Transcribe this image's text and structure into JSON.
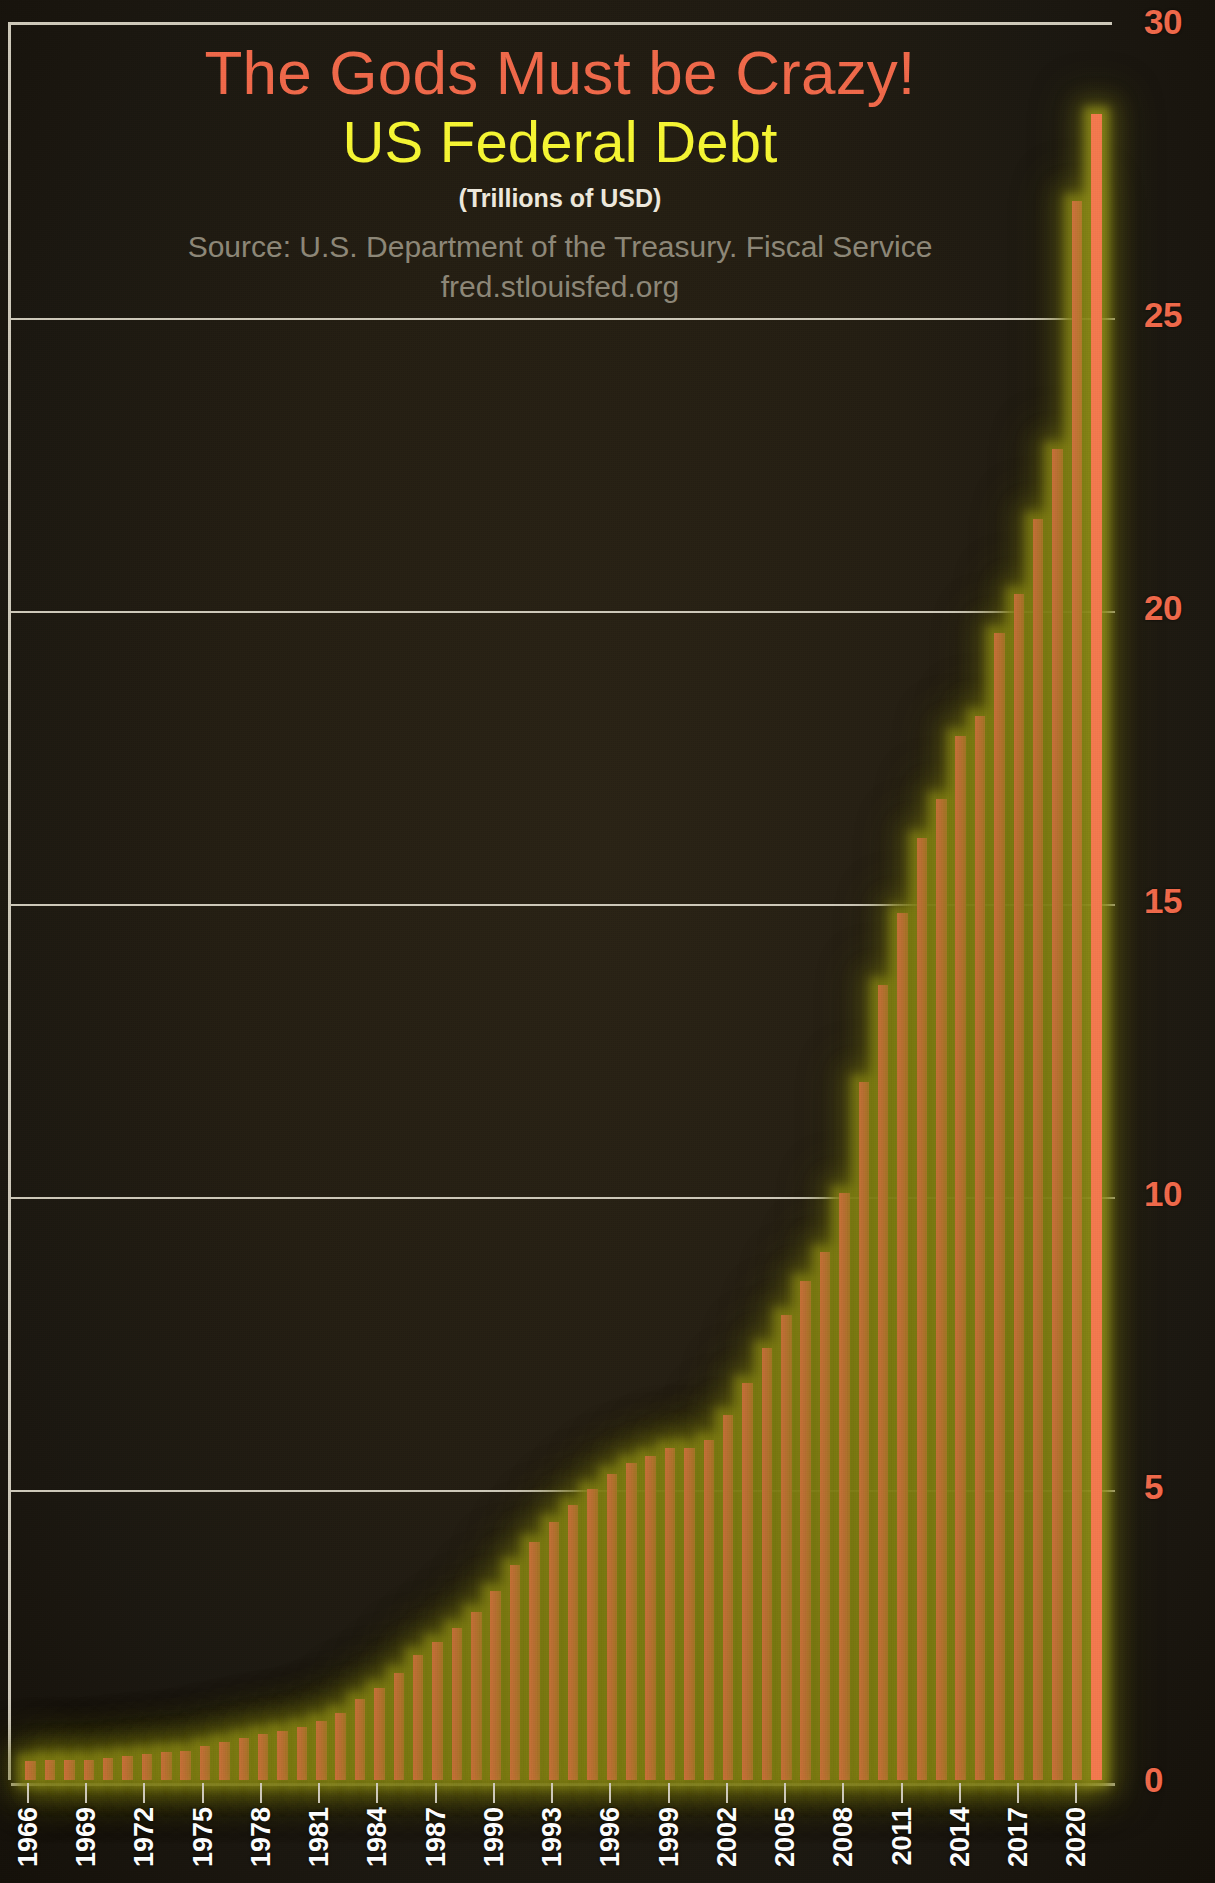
{
  "titles": {
    "headline": "The Gods Must be Crazy!",
    "subject": "US Federal Debt",
    "units": "(Trillions of USD)",
    "source_line1": "Source: U.S. Department of the Treasury. Fiscal Service",
    "source_line2": "fred.stlouisfed.org"
  },
  "colors": {
    "headline": "#f1694a",
    "subject": "#f7f733",
    "units": "#efeade",
    "source": "#8e8878",
    "bar": "#f4794e",
    "bar_glow": "#969418",
    "axis_label_y": "#f1694a",
    "axis_label_x": "#ffffff",
    "gridline": "#cfcabb",
    "background": "#241e12"
  },
  "chart_data": {
    "type": "bar",
    "title": "The Gods Must be Crazy! US Federal Debt",
    "subtitle": "(Trillions of USD)",
    "xlabel": "",
    "ylabel": "Trillions of USD",
    "ylim": [
      0,
      30
    ],
    "yticks": [
      0,
      5,
      10,
      15,
      20,
      25,
      30
    ],
    "ytick_labels": [
      "0",
      "5",
      "10",
      "15",
      "20",
      "25",
      "30"
    ],
    "grid": true,
    "legend": "none",
    "xtick_labels": [
      "1966",
      "1969",
      "1972",
      "1975",
      "1978",
      "1981",
      "1984",
      "1987",
      "1990",
      "1993",
      "1996",
      "1999",
      "2002",
      "2005",
      "2008",
      "2011",
      "2014",
      "2017",
      "2020"
    ],
    "xtick_every": 3,
    "categories": [
      "1966",
      "1967",
      "1968",
      "1969",
      "1970",
      "1971",
      "1972",
      "1973",
      "1974",
      "1975",
      "1976",
      "1977",
      "1978",
      "1979",
      "1980",
      "1981",
      "1982",
      "1983",
      "1984",
      "1985",
      "1986",
      "1987",
      "1988",
      "1989",
      "1990",
      "1991",
      "1992",
      "1993",
      "1994",
      "1995",
      "1996",
      "1997",
      "1998",
      "1999",
      "2000",
      "2001",
      "2002",
      "2003",
      "2004",
      "2005",
      "2006",
      "2007",
      "2008",
      "2009",
      "2010",
      "2011",
      "2012",
      "2013",
      "2014",
      "2015",
      "2016",
      "2017",
      "2018",
      "2019",
      "2020",
      "2021"
    ],
    "values": [
      0.32,
      0.34,
      0.35,
      0.35,
      0.37,
      0.41,
      0.44,
      0.47,
      0.49,
      0.58,
      0.65,
      0.72,
      0.78,
      0.83,
      0.91,
      1.0,
      1.14,
      1.38,
      1.57,
      1.82,
      2.13,
      2.35,
      2.6,
      2.86,
      3.23,
      3.67,
      4.06,
      4.41,
      4.69,
      4.97,
      5.22,
      5.41,
      5.53,
      5.66,
      5.67,
      5.81,
      6.23,
      6.78,
      7.38,
      7.93,
      8.51,
      9.01,
      10.02,
      11.91,
      13.56,
      14.79,
      16.07,
      16.74,
      17.82,
      18.15,
      19.57,
      20.24,
      21.52,
      22.72,
      26.95,
      28.43
    ]
  }
}
